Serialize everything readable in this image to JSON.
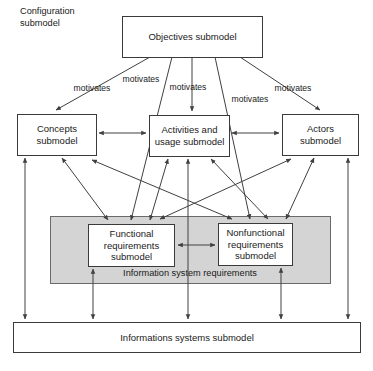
{
  "diagram": {
    "title_label": "Configuration submodel",
    "title_line1": "Configuration",
    "title_line2": "submodel",
    "group_label": "Information system requirements",
    "colors": {
      "group_fill": "#d4d4d4",
      "box_fill": "#ffffff",
      "stroke": "#404040",
      "background": "#ffffff"
    },
    "nodes": [
      {
        "id": "objectives",
        "name": "objectives-submodel-box",
        "lines": [
          "Objectives submodel"
        ],
        "x": 122,
        "y": 16,
        "w": 140,
        "h": 41
      },
      {
        "id": "concepts",
        "name": "concepts-submodel-box",
        "lines": [
          "Concepts",
          "submodel"
        ],
        "x": 17,
        "y": 114,
        "w": 79,
        "h": 41
      },
      {
        "id": "activities",
        "name": "activities-and-usage-submodel-box",
        "lines": [
          "Activities and",
          "usage submodel"
        ],
        "x": 149,
        "y": 115,
        "w": 80,
        "h": 41
      },
      {
        "id": "actors",
        "name": "actors-submodel-box",
        "lines": [
          "Actors",
          "submodel"
        ],
        "x": 282,
        "y": 114,
        "w": 76,
        "h": 41
      },
      {
        "id": "functional",
        "name": "functional-requirements-submodel-box",
        "lines": [
          "Functional",
          "requirements",
          "submodel"
        ],
        "x": 88,
        "y": 224,
        "w": 86,
        "h": 42
      },
      {
        "id": "nonfunctional",
        "name": "nonfunctional-requirements-submodel-box",
        "lines": [
          "Nonfunctional",
          "requirements",
          "submodel"
        ],
        "x": 218,
        "y": 223,
        "w": 74,
        "h": 42
      },
      {
        "id": "information_systems",
        "name": "informations-systems-submodel-box",
        "lines": [
          "Informations systems submodel"
        ],
        "x": 13,
        "y": 322,
        "w": 347,
        "h": 30
      }
    ],
    "group_box": {
      "name": "information-system-requirements-group",
      "x": 50,
      "y": 216,
      "w": 280,
      "h": 67,
      "label_x": 190,
      "label_y": 274
    },
    "edge_labels": [
      {
        "name": "motivates-label-concepts",
        "text": "motivates",
        "x": 92,
        "y": 89
      },
      {
        "name": "motivates-label-functional",
        "text": "motivates",
        "x": 141,
        "y": 80
      },
      {
        "name": "motivates-label-activities",
        "text": "motivates",
        "x": 188,
        "y": 88
      },
      {
        "name": "motivates-label-nonfunctional",
        "text": "motivates",
        "x": 250,
        "y": 100
      },
      {
        "name": "motivates-label-actors",
        "text": "motivates",
        "x": 293,
        "y": 89
      }
    ],
    "edges": [
      {
        "name": "edge-objectives-to-concepts",
        "type": "motivates"
      },
      {
        "name": "edge-objectives-to-functional",
        "type": "motivates"
      },
      {
        "name": "edge-objectives-to-activities",
        "type": "motivates"
      },
      {
        "name": "edge-objectives-to-nonfunctional",
        "type": "motivates"
      },
      {
        "name": "edge-objectives-to-actors",
        "type": "motivates"
      },
      {
        "name": "edge-concepts-activities",
        "type": "bidirectional"
      },
      {
        "name": "edge-activities-actors",
        "type": "bidirectional"
      },
      {
        "name": "edge-functional-nonfunctional",
        "type": "bidirectional"
      },
      {
        "name": "edge-concepts-functional",
        "type": "bidirectional"
      },
      {
        "name": "edge-concepts-nonfunctional",
        "type": "bidirectional"
      },
      {
        "name": "edge-activities-functional",
        "type": "bidirectional"
      },
      {
        "name": "edge-activities-nonfunctional",
        "type": "bidirectional"
      },
      {
        "name": "edge-actors-functional",
        "type": "bidirectional"
      },
      {
        "name": "edge-actors-nonfunctional",
        "type": "bidirectional"
      },
      {
        "name": "edge-concepts-information-systems",
        "type": "bidirectional"
      },
      {
        "name": "edge-activities-information-systems",
        "type": "bidirectional"
      },
      {
        "name": "edge-actors-information-systems",
        "type": "bidirectional"
      },
      {
        "name": "edge-functional-information-systems",
        "type": "bidirectional"
      },
      {
        "name": "edge-nonfunctional-information-systems",
        "type": "bidirectional"
      }
    ]
  }
}
